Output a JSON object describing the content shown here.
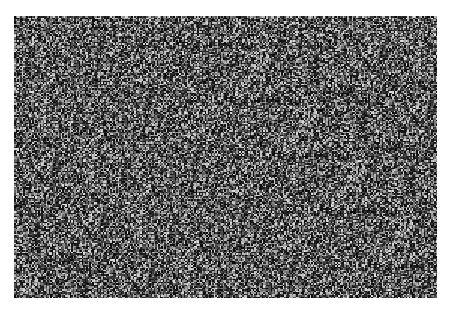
{
  "canvas": {
    "width": 452,
    "height": 309,
    "background": "#ffffff"
  },
  "noise_region": {
    "x": 14,
    "y": 16,
    "width": 423,
    "height": 282,
    "type": "grayscale-random-noise",
    "min_gray": "#0a0a0a",
    "max_gray": "#d8d8d8",
    "mean_gray": "#3a3a3a"
  }
}
